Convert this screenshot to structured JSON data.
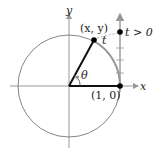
{
  "diagram": {
    "labels": {
      "y_axis": "y",
      "x_axis": "x",
      "point_xy": "(x, y)",
      "point_10": "(1, 0)",
      "theta": "θ",
      "t": "t",
      "t_positive": "t > 0"
    },
    "colors": {
      "axis": "#999999",
      "circle": "#777777",
      "arc": "#999999",
      "radius": "#111111",
      "point": "#000000"
    }
  }
}
